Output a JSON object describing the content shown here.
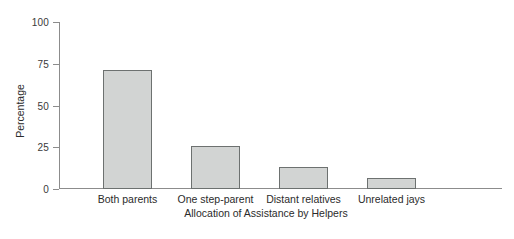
{
  "chart_data": {
    "type": "bar",
    "title": "",
    "xlabel": "Allocation of Assistance by Helpers",
    "ylabel": "Percentage",
    "categories": [
      "Both parents",
      "One step-parent",
      "Distant relatives",
      "Unrelated jays"
    ],
    "values": [
      71,
      25.5,
      13,
      6.5
    ],
    "ylim": [
      0,
      100
    ],
    "yticks": [
      0,
      25,
      50,
      75,
      100
    ],
    "ytick_labels": [
      "0",
      "25",
      "50",
      "75",
      "100"
    ],
    "grid": false,
    "legend": false,
    "bar_fill_color": "#d2d4d3",
    "bar_edge_color": "#6d7170",
    "axis_color": "#8c8c8c",
    "background_color": "#ffffff"
  },
  "axes": {
    "y_title": "Percentage",
    "x_title": "Allocation of Assistance by Helpers"
  },
  "ticks": {
    "y": [
      {
        "label": "100",
        "value": 100
      },
      {
        "label": "75",
        "value": 75
      },
      {
        "label": "50",
        "value": 50
      },
      {
        "label": "25",
        "value": 25
      },
      {
        "label": "0",
        "value": 0
      }
    ]
  },
  "bars": [
    {
      "label": "Both parents",
      "value": 71
    },
    {
      "label": "One step-parent",
      "value": 25.5
    },
    {
      "label": "Distant relatives",
      "value": 13
    },
    {
      "label": "Unrelated jays",
      "value": 6.5
    }
  ]
}
